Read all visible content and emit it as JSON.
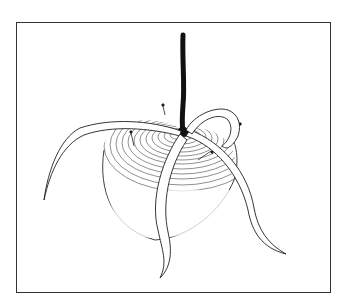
{
  "caption": {
    "visible_text": "",
    "note_state": "truncated at top edge; only letter descenders visible"
  },
  "figure": {
    "border_color": "#333333",
    "ink_color": "#1a1a1a",
    "background": "#ffffff"
  }
}
